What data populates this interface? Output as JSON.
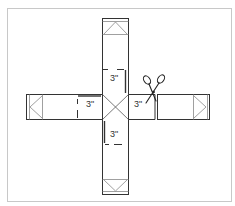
{
  "diagram": {
    "labels": {
      "top": "3\"",
      "left": "3\"",
      "right": "3\"",
      "bottom": "3\""
    },
    "icons": {
      "scissors": "scissors-icon"
    },
    "colors": {
      "line": "#333333",
      "frame": "#c8c8c8",
      "flap": "#888888"
    }
  }
}
